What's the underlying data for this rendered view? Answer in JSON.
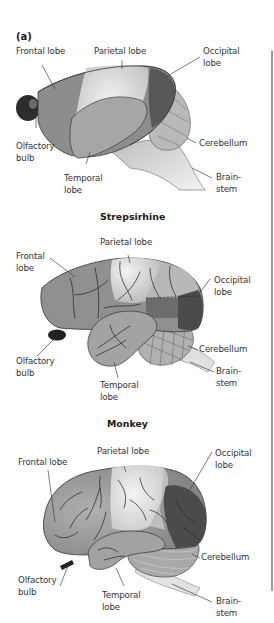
{
  "figure": {
    "panel_label": "(a)",
    "colors": {
      "frontal": "#8c8c8c",
      "parietal": "#c9c9c9",
      "parietal_highlight": "#ededed",
      "temporal": "#a8a8a8",
      "occipital": "#555555",
      "cerebellum": "#b4b4b4",
      "brainstem": "#d8d8d8",
      "olfactory": "#2a2a2a",
      "divider": "#9a9a9a"
    },
    "brains": [
      {
        "title": "",
        "labels": {
          "frontal": "Frontal lobe",
          "parietal": "Parietal lobe",
          "occipital": "Occipital\nlobe",
          "olfactory": "Olfactory\nbulb",
          "temporal": "Temporal\nlobe",
          "cerebellum": "Cerebellum",
          "brainstem": "Brain-\nstem"
        }
      },
      {
        "title": "Strepsirhine",
        "labels": {
          "frontal": "Frontal\nlobe",
          "parietal": "Parietal lobe",
          "occipital": "Occipital\nlobe",
          "olfactory": "Olfactory\nbulb",
          "temporal": "Temporal\nlobe",
          "cerebellum": "Cerebellum",
          "brainstem": "Brain-\nstem"
        }
      },
      {
        "title": "Monkey",
        "labels": {
          "frontal": "Frontal lobe",
          "parietal": "Parietal lobe",
          "occipital": "Occipital\nlobe",
          "olfactory": "Olfactory\nbulb",
          "temporal": "Temporal\nlobe",
          "cerebellum": "Cerebellum",
          "brainstem": "Brain-\nstem"
        }
      }
    ]
  }
}
